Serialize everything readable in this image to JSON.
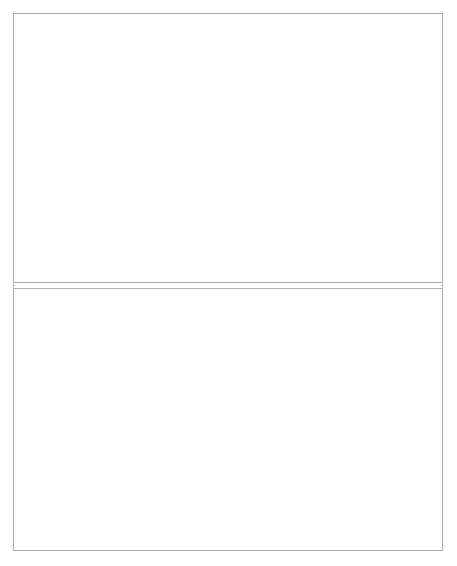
{
  "figure": {
    "title_line1": "Complex Sentences",
    "title_line2": "Wh- and NP-Movement",
    "xlabel": "Probe Sessions"
  },
  "chart_data": [
    {
      "type": "line",
      "panel": "top",
      "title": "Complex Sentences / Wh- and NP-Movement",
      "xlabel": "",
      "ylabel": "Wh-Movement Structures",
      "ylim": [
        0,
        100
      ],
      "yticks": [
        0,
        20,
        40,
        60,
        80,
        100
      ],
      "xlim": [
        0.5,
        51
      ],
      "xticks": [
        1,
        4,
        7,
        10,
        13,
        16,
        19,
        22,
        25,
        28,
        31,
        34,
        37,
        40,
        43,
        46,
        49
      ],
      "grid": false,
      "legend_position": "right",
      "annotations": [
        {
          "text": "Object Cleft Training",
          "x_start": 5.5,
          "x_end": 25.5,
          "label_x": 7
        }
      ],
      "phase_lines": [
        5.5,
        25.5
      ],
      "series": [
        {
          "name": "who-questions",
          "marker": "diamond",
          "linestyle": "dashed",
          "x": [
            2,
            4,
            6,
            8,
            10,
            12,
            14,
            16,
            18,
            20,
            22,
            24,
            26,
            28,
            30,
            32,
            34,
            36,
            38,
            40,
            42,
            44,
            50
          ],
          "values": [
            30,
            25,
            20,
            15,
            12,
            20,
            12,
            20,
            20,
            30,
            40,
            48,
            45,
            30,
            30,
            40,
            50,
            55,
            60,
            55,
            60,
            65,
            54
          ]
        },
        {
          "name": "object clefts",
          "marker": "circle",
          "linestyle": "solid",
          "x": [
            2,
            4,
            6,
            8,
            10,
            12,
            14,
            16,
            18,
            20,
            22,
            24,
            26,
            28,
            30,
            32,
            34,
            36,
            38,
            40,
            42,
            44,
            46,
            50
          ],
          "values": [
            2,
            2,
            20,
            45,
            30,
            60,
            55,
            40,
            70,
            80,
            65,
            80,
            50,
            55,
            64,
            65,
            60,
            60,
            70,
            65,
            60,
            70,
            65,
            69
          ]
        }
      ]
    },
    {
      "type": "line",
      "panel": "bottom",
      "title": "",
      "xlabel": "Probe Sessions",
      "ylabel": "NP-Movement Structure",
      "ylim": [
        0,
        100
      ],
      "yticks": [
        0,
        20,
        40,
        60,
        80,
        100
      ],
      "xlim": [
        0.5,
        51
      ],
      "xticks": [
        1,
        4,
        7,
        10,
        13,
        16,
        19,
        22,
        25,
        28,
        31,
        34,
        37,
        40,
        43,
        46,
        49
      ],
      "grid": false,
      "legend_position": "right",
      "annotations": [
        {
          "text": "Subject Raising Training",
          "x_start": 25.5,
          "x_end": 51,
          "label_x": 28
        }
      ],
      "phase_lines": [
        25.5
      ],
      "series": [
        {
          "name": "passives",
          "marker": "diamond",
          "linestyle": "dashed",
          "x": [
            2,
            4,
            6,
            8,
            10,
            12,
            14,
            16,
            18,
            20,
            22,
            24,
            26,
            28,
            30,
            32,
            34,
            36,
            38,
            40,
            42,
            44,
            46,
            50
          ],
          "values": [
            2,
            2,
            2,
            2,
            2,
            2,
            2,
            2,
            2,
            2,
            2,
            2,
            1,
            4,
            4,
            11,
            11,
            6,
            11,
            29,
            39,
            59,
            59,
            54
          ]
        },
        {
          "name": "subject raising",
          "marker": "circle",
          "linestyle": "solid",
          "x": [
            2,
            4,
            6,
            8,
            10,
            12,
            14,
            16,
            18,
            20,
            22,
            24,
            26,
            28,
            30,
            32,
            34,
            36,
            38,
            40,
            42,
            44,
            46,
            50
          ],
          "values": [
            2,
            6,
            3,
            5,
            3,
            7,
            3,
            7,
            3,
            7,
            5,
            3,
            9,
            29,
            19,
            39,
            39,
            49,
            59,
            59,
            69,
            79,
            74,
            69
          ]
        }
      ]
    }
  ],
  "legends": {
    "top": [
      {
        "label": "who-questions",
        "marker": "diamond",
        "linestyle": "dashed"
      },
      {
        "label": "object clefts",
        "marker": "circle",
        "linestyle": "solid"
      }
    ],
    "bottom": [
      {
        "label": "passives",
        "marker": "diamond",
        "linestyle": "dashed"
      },
      {
        "label": "subject raising",
        "marker": "circle",
        "linestyle": "solid"
      }
    ]
  },
  "colors": {
    "ink": "#111111",
    "frame": "#b0b0b0",
    "phase_line": "#777777",
    "background": "#ffffff"
  }
}
